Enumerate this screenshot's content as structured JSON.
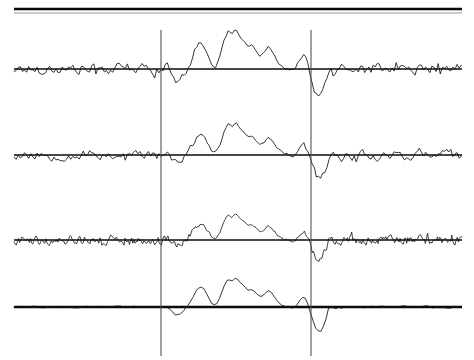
{
  "figure": {
    "background_color": "#ffffff",
    "trace_color": "#111111",
    "baseline_color": "#0b0b0b",
    "marker_color": "#4a4a4a",
    "width": 474,
    "height": 360,
    "top_rule": {
      "thick_line_y": 9,
      "thin_line_y": 13,
      "x_start": 14,
      "x_end": 462,
      "thick_color": "#0a0a0a",
      "thin_color": "#9a9a9a"
    },
    "markers": [
      {
        "name": "stimulus-onset-marker",
        "x": 161,
        "y_top": 30,
        "y_bottom": 356
      },
      {
        "name": "response-offset-marker",
        "x": 311,
        "y_top": 30,
        "y_bottom": 356
      }
    ],
    "x_start": 14,
    "x_end": 462,
    "traces": [
      {
        "name": "trace-1",
        "baseline_y": 69,
        "noise_amplitude": 9,
        "noise_step": 2.1,
        "noise_seed": 17,
        "burst_scale": 1.0,
        "baseline_weight": "normal"
      },
      {
        "name": "trace-2",
        "baseline_y": 155,
        "noise_amplitude": 8,
        "noise_step": 2.1,
        "noise_seed": 53,
        "burst_scale": 0.9,
        "baseline_weight": "normal"
      },
      {
        "name": "trace-3",
        "baseline_y": 240,
        "noise_amplitude": 7,
        "noise_step": 1.1,
        "noise_seed": 91,
        "burst_scale": 0.8,
        "baseline_weight": "normal"
      },
      {
        "name": "trace-4",
        "baseline_y": 307,
        "noise_amplitude": 1.6,
        "noise_step": 2.6,
        "noise_seed": 131,
        "burst_scale": 0.88,
        "baseline_weight": "thick"
      }
    ]
  },
  "chart_data": {
    "type": "line",
    "subtitle": "",
    "xlabel": "",
    "ylabel": "",
    "grid": false,
    "legend": "none",
    "axis_ranges": {
      "x": [
        14,
        462
      ],
      "y_per_trace": "arbitrary amplitude units, centred on each baseline"
    },
    "annotations": [
      {
        "label": "vertical marker 1",
        "x": 161
      },
      {
        "label": "vertical marker 2",
        "x": 311
      },
      {
        "label": "top double rule",
        "y": 9
      }
    ],
    "series": [
      {
        "name": "trace-1",
        "baseline_y": 69,
        "description": "broadband noise with large central evoked burst and deep late negative deflection",
        "burst_x": [
          168,
          172,
          176,
          180,
          184,
          188,
          192,
          196,
          200,
          204,
          208,
          212,
          216,
          220,
          224,
          228,
          232,
          236,
          240,
          244,
          248,
          252,
          256,
          260,
          264,
          268,
          272,
          276,
          280,
          284,
          288,
          292,
          296,
          300,
          304,
          308,
          312,
          316,
          320,
          324,
          328
        ],
        "burst_y": [
          1,
          -6,
          -10,
          -8,
          -4,
          2,
          10,
          20,
          27,
          24,
          14,
          4,
          2,
          12,
          28,
          38,
          34,
          40,
          33,
          28,
          22,
          24,
          18,
          12,
          16,
          22,
          18,
          10,
          4,
          1,
          0,
          -1,
          0,
          8,
          14,
          4,
          -14,
          -26,
          -30,
          -22,
          -6
        ]
      },
      {
        "name": "trace-2",
        "baseline_y": 155,
        "description": "broadband noise with central evoked burst, slightly smaller amplitude",
        "burst_x": [
          168,
          172,
          176,
          180,
          184,
          188,
          192,
          196,
          200,
          204,
          208,
          212,
          216,
          220,
          224,
          228,
          232,
          236,
          240,
          244,
          248,
          252,
          256,
          260,
          264,
          268,
          272,
          276,
          280,
          284,
          288,
          292,
          296,
          300,
          304,
          308,
          312,
          316,
          320,
          324,
          328
        ],
        "burst_y": [
          1,
          -5,
          -9,
          -7,
          -3,
          2,
          9,
          18,
          24,
          22,
          13,
          4,
          2,
          11,
          25,
          34,
          31,
          36,
          30,
          25,
          20,
          21,
          16,
          11,
          14,
          20,
          16,
          9,
          4,
          1,
          0,
          -1,
          0,
          7,
          13,
          4,
          -13,
          -24,
          -28,
          -20,
          -5
        ]
      },
      {
        "name": "trace-3",
        "baseline_y": 240,
        "description": "dense high-frequency noise with central evoked burst",
        "burst_x": [
          168,
          172,
          176,
          180,
          184,
          188,
          192,
          196,
          200,
          204,
          208,
          212,
          216,
          220,
          224,
          228,
          232,
          236,
          240,
          244,
          248,
          252,
          256,
          260,
          264,
          268,
          272,
          276,
          280,
          284,
          288,
          292,
          296,
          300,
          304,
          308,
          312,
          316,
          320,
          324,
          328
        ],
        "burst_y": [
          1,
          -4,
          -8,
          -6,
          -2,
          2,
          8,
          16,
          22,
          20,
          12,
          3,
          2,
          10,
          23,
          31,
          28,
          33,
          27,
          23,
          18,
          19,
          15,
          10,
          13,
          18,
          15,
          8,
          3,
          1,
          0,
          -1,
          0,
          7,
          12,
          3,
          -12,
          -22,
          -26,
          -18,
          -5
        ]
      },
      {
        "name": "trace-4",
        "baseline_y": 307,
        "description": "averaged trace, flat outside the evoked burst",
        "burst_x": [
          168,
          172,
          176,
          180,
          184,
          188,
          192,
          196,
          200,
          204,
          208,
          212,
          216,
          220,
          224,
          228,
          232,
          236,
          240,
          244,
          248,
          252,
          256,
          260,
          264,
          268,
          272,
          276,
          280,
          284,
          288,
          292,
          296,
          300,
          304,
          308,
          312,
          316,
          320,
          324,
          328
        ],
        "burst_y": [
          0,
          -5,
          -10,
          -8,
          -4,
          2,
          9,
          18,
          23,
          21,
          12,
          3,
          2,
          11,
          24,
          32,
          29,
          34,
          28,
          24,
          19,
          20,
          16,
          11,
          14,
          19,
          16,
          9,
          3,
          1,
          0,
          -1,
          0,
          8,
          13,
          3,
          -13,
          -25,
          -29,
          -20,
          -5
        ]
      }
    ]
  }
}
